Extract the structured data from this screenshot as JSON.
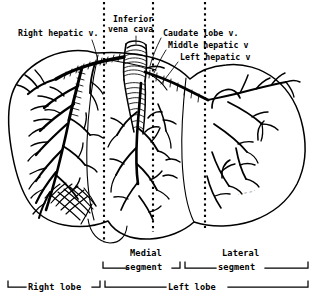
{
  "figure": {
    "style": "black-and-white pen-and-ink anatomical line drawing",
    "background_color": "#ffffff",
    "ink_color": "#000000"
  },
  "labels": [
    {
      "id": "right-hepatic-vein",
      "text": "Right hepatic v.",
      "x": 18,
      "y": 36
    },
    {
      "id": "inferior-vena-cava-line1",
      "text": "Inferior",
      "x": 113,
      "y": 22
    },
    {
      "id": "inferior-vena-cava-line2",
      "text": "vena cava",
      "x": 108,
      "y": 32
    },
    {
      "id": "caudate-lobe-vein",
      "text": "Caudate lobe v.",
      "x": 163,
      "y": 36
    },
    {
      "id": "middle-hepatic-vein",
      "text": "Middle hepatic v",
      "x": 168,
      "y": 48
    },
    {
      "id": "left-hepatic-vein",
      "text": "Left hepatic v",
      "x": 180,
      "y": 60
    }
  ],
  "bracket_labels": [
    {
      "id": "medial-segment",
      "line1": "Medial",
      "line2": "segment",
      "text_x": 130,
      "text_y1": 255,
      "text_y2": 266,
      "bracket_start": 103,
      "bracket_end": 180,
      "bracket_y": 267
    },
    {
      "id": "lateral-segment",
      "line1": "Lateral",
      "line2": "segment",
      "text_x": 222,
      "text_y1": 255,
      "text_y2": 266,
      "bracket_start": 185,
      "bracket_end": 308,
      "bracket_y": 267
    },
    {
      "id": "right-lobe",
      "line1": "Right lobe",
      "bracket_start": 8,
      "bracket_end": 100,
      "bracket_y": 286,
      "text_x": 28,
      "text_y1": 285
    },
    {
      "id": "left-lobe",
      "line1": "Left lobe",
      "bracket_start": 105,
      "bracket_end": 308,
      "bracket_y": 286,
      "text_x": 168,
      "text_y1": 285
    }
  ],
  "division_lines": [
    {
      "id": "right-lobe-boundary",
      "x": 104,
      "y_top": 2,
      "y_bottom": 243
    },
    {
      "id": "medial-lateral-boundary",
      "x": 153,
      "y_top": 2,
      "y_bottom": 232
    },
    {
      "id": "left-lobe-boundary",
      "x": 205,
      "y_top": 2,
      "y_bottom": 228
    }
  ],
  "anatomy_regions": [
    {
      "id": "right-lobe-region",
      "description": "Right lobe with dense filled venous tributaries"
    },
    {
      "id": "medial-segment-region",
      "description": "Medial segment of left lobe"
    },
    {
      "id": "lateral-segment-region",
      "description": "Lateral segment of left lobe with open outline branches"
    },
    {
      "id": "caudate-lobe-region",
      "description": "Caudate lobe adjacent to inferior vena cava"
    },
    {
      "id": "gallbladder-region",
      "description": "Gallbladder fossa at inferior right margin"
    },
    {
      "id": "ivc-trunk",
      "description": "Inferior vena cava cylindrical trunk with ring hatching"
    }
  ],
  "signature": {
    "text": "illegible artist signature",
    "x": 238,
    "y": 196
  }
}
